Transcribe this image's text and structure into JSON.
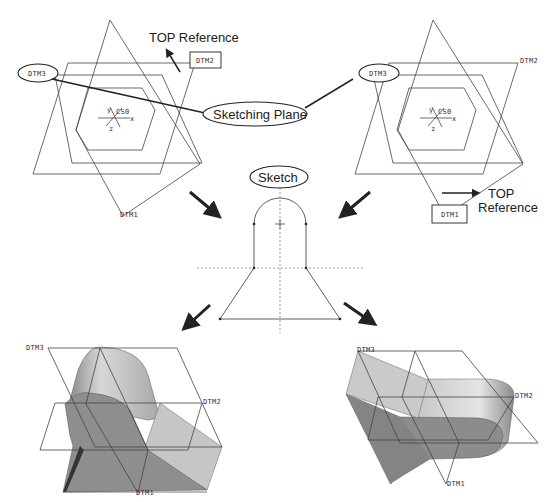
{
  "labels": {
    "top_reference_left": "TOP Reference",
    "sketching_plane": "Sketching Plane",
    "top_reference_right_1": "TOP",
    "top_reference_right_2": "Reference",
    "sketch": "Sketch"
  },
  "datums": {
    "left": {
      "dtm1": "DTM1",
      "dtm2": "DTM2",
      "dtm3": "DTM3",
      "csys": "CS0",
      "x": "x",
      "y": "y",
      "z": "z"
    },
    "right": {
      "dtm1": "DTM1",
      "dtm2": "DTM2",
      "dtm3": "DTM3",
      "csys": "CS0",
      "x": "x",
      "y": "y",
      "z": "z"
    },
    "bottom_left": {
      "dtm1": "DTM1",
      "dtm2": "DTM2",
      "dtm3": "DTM3"
    },
    "bottom_right": {
      "dtm1": "DTM1",
      "dtm2": "DTM2",
      "dtm3": "DTM3"
    }
  },
  "colors": {
    "line": "#444444",
    "solid_dark": "#7a7a7a",
    "solid_mid": "#9a9a9a",
    "solid_light": "#c8c8c8"
  }
}
